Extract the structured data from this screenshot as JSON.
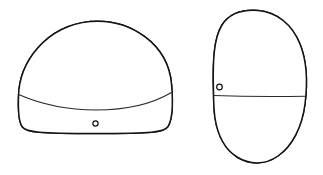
{
  "figure": {
    "domain_kind": "line-art-illustration",
    "caption": "",
    "background_color": "#ffffff",
    "ink_color": "#141414",
    "stipple_color": "#8f8f8f",
    "stipple_background": "#ffffff",
    "canvas": {
      "width": 323,
      "height": 175
    },
    "objects": [
      {
        "id": "left-object",
        "name": "dome-shaped-artifact-side-view",
        "label": "",
        "bounds": {
          "x": 17,
          "y": 20,
          "width": 156,
          "height": 114
        },
        "outline_path": "M 18.5 97 C 19 62 46 26 90 21.5 C 130 18 168 44 171.5 84 C 173.5 107 172 120 168 126.5 C 164 132.5 152 133.5 95 133.5 C 40 133.5 26 132.5 22 126.5 C 18.5 121 18 112 18.5 97 Z",
        "divider_path": "M 18.6 94.5 C 45 106 70 110 96 110 C 126 110 152 104 171.4 92.5",
        "divider_note": "boundary between plain upper surface and stippled lower band",
        "fill_region_path": "M 18.6 94.5 C 45 106 70 110 96 110 C 126 110 152 104 171.4 92.5 C 172.6 108 172 120 168 126.5 C 164 132.5 152 133.5 95 133.5 C 40 133.5 26 132.5 22 126.5 C 18.5 121 18 110 18.6 94.5 Z",
        "fill_style": "fine-stipple",
        "perforation": {
          "name": "suspension-hole",
          "cx": 95.5,
          "cy": 123.5,
          "r": 2.6,
          "shape": "circle"
        }
      },
      {
        "id": "right-object",
        "name": "oval-artifact-end-view",
        "label": "",
        "bounds": {
          "x": 212,
          "y": 9,
          "width": 95,
          "height": 155
        },
        "outline_path": "M 213.5 92 C 212.5 60 214 38 222 25 C 230 12.5 244 9.5 258 10.5 C 276 11.8 292 24 300 44 C 307.5 62.5 307.5 84 305 104 C 302 127.5 292 146 278 156 C 264.5 165.5 249 164.5 237 157 C 224.5 149 217.5 134 215 118 C 213.8 110 213.6 100.5 213.5 92 Z",
        "divider_path": "M 213.6 95.5 C 240 96.5 275 96.8 305.6 96.2",
        "divider_note": "boundary between plain upper surface and stippled lower band",
        "fill_region_path": "M 213.6 95.5 C 240 96.5 275 96.8 305.6 96.2 C 303.5 122 293 145 278 156 C 264.5 165.5 249 164.5 237 157 C 224.5 149 217.5 134 215 118 C 213.9 110.5 213.6 102.5 213.6 95.5 Z",
        "fill_style": "fine-stipple",
        "perforation": {
          "name": "suspension-hole",
          "cx": 219.5,
          "cy": 87.0,
          "r": 2.8,
          "shape": "circle"
        }
      }
    ]
  }
}
